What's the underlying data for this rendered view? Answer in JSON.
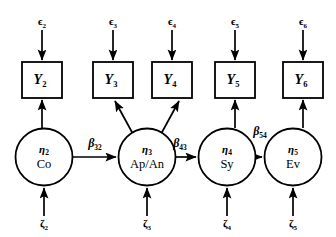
{
  "diagram": {
    "type": "structural-equation-model-path-diagram",
    "latent_variables": [
      {
        "id": "eta2",
        "symbol": "η",
        "subscript": "2",
        "name": "Co",
        "cx": 44,
        "cy": 157,
        "r": 28.5
      },
      {
        "id": "eta3",
        "symbol": "η",
        "subscript": "3",
        "name": "Ap/An",
        "cx": 147,
        "cy": 157,
        "r": 28.5
      },
      {
        "id": "eta4",
        "symbol": "η",
        "subscript": "4",
        "name": "Sy",
        "cx": 227,
        "cy": 157,
        "r": 28.5
      },
      {
        "id": "eta5",
        "symbol": "η",
        "subscript": "5",
        "name": "Ev",
        "cx": 293,
        "cy": 157,
        "r": 28.5
      }
    ],
    "observed_variables": [
      {
        "id": "Y2",
        "symbol": "Y",
        "subscript": "2",
        "x": 22,
        "y": 62,
        "w": 40,
        "h": 36
      },
      {
        "id": "Y3",
        "symbol": "Y",
        "subscript": "3",
        "x": 93,
        "y": 62,
        "w": 40,
        "h": 36
      },
      {
        "id": "Y4",
        "symbol": "Y",
        "subscript": "4",
        "x": 152,
        "y": 62,
        "w": 40,
        "h": 36
      },
      {
        "id": "Y5",
        "symbol": "Y",
        "subscript": "5",
        "x": 215,
        "y": 62,
        "w": 40,
        "h": 36
      },
      {
        "id": "Y6",
        "symbol": "Y",
        "subscript": "6",
        "x": 283,
        "y": 62,
        "w": 40,
        "h": 36
      }
    ],
    "measurement_errors": [
      {
        "id": "eps2",
        "symbol": "ϵ",
        "subscript": "2",
        "x": 42,
        "y": 22
      },
      {
        "id": "eps3",
        "symbol": "ϵ",
        "subscript": "3",
        "x": 113,
        "y": 22
      },
      {
        "id": "eps4",
        "symbol": "ϵ",
        "subscript": "4",
        "x": 172,
        "y": 22
      },
      {
        "id": "eps5",
        "symbol": "ϵ",
        "subscript": "5",
        "x": 235,
        "y": 22
      },
      {
        "id": "eps6",
        "symbol": "ϵ",
        "subscript": "6",
        "x": 303,
        "y": 22
      }
    ],
    "disturbances": [
      {
        "id": "zeta2",
        "symbol": "ζ",
        "subscript": "2",
        "x": 44,
        "y": 224
      },
      {
        "id": "zeta3",
        "symbol": "ζ",
        "subscript": "3",
        "x": 147,
        "y": 224
      },
      {
        "id": "zeta4",
        "symbol": "ζ",
        "subscript": "4",
        "x": 227,
        "y": 224
      },
      {
        "id": "zeta5",
        "symbol": "ζ",
        "subscript": "5",
        "x": 293,
        "y": 224
      }
    ],
    "path_coefficients": [
      {
        "id": "beta32",
        "symbol": "β",
        "subscript": "32",
        "from": "eta2",
        "to": "eta3",
        "x": 95,
        "y": 144
      },
      {
        "id": "beta43",
        "symbol": "β",
        "subscript": "43",
        "from": "eta3",
        "to": "eta4",
        "x": 180,
        "y": 144
      },
      {
        "id": "beta54",
        "symbol": "β",
        "subscript": "54",
        "from": "eta4",
        "to": "eta5",
        "x": 260,
        "y": 132
      }
    ],
    "colors": {
      "stroke": "#000000",
      "fill": "#ffffff",
      "background": "#ffffff"
    }
  }
}
